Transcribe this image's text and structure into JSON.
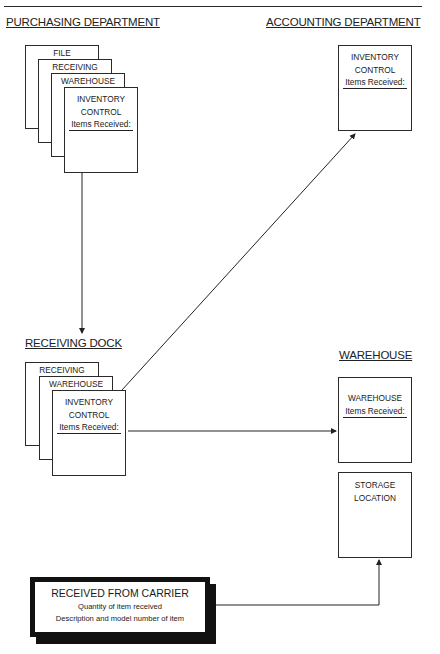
{
  "sections": {
    "purchasing": {
      "title": "PURCHASING DEPARTMENT",
      "cards": [
        {
          "label": "FILE"
        },
        {
          "label": "RECEIVING"
        },
        {
          "label": "WAREHOUSE"
        },
        {
          "label_line1": "INVENTORY",
          "label_line2": "CONTROL",
          "items": "Items Received:"
        }
      ]
    },
    "accounting": {
      "title": "ACCOUNTING DEPARTMENT",
      "card": {
        "label_line1": "INVENTORY",
        "label_line2": "CONTROL",
        "items": "Items Received:"
      }
    },
    "receiving_dock": {
      "title": "RECEIVING DOCK",
      "cards": [
        {
          "label": "RECEIVING"
        },
        {
          "label": "WAREHOUSE"
        },
        {
          "label_line1": "INVENTORY",
          "label_line2": "CONTROL",
          "items": "Items Received:"
        }
      ]
    },
    "warehouse": {
      "title": "WAREHOUSE",
      "card": {
        "label": "WAREHOUSE",
        "items": "Items Received:"
      },
      "storage": {
        "label_line1": "STORAGE",
        "label_line2": "LOCATION"
      }
    },
    "carrier": {
      "title": "RECEIVED FROM CARRIER",
      "line1": "Quantity of item received",
      "line2": "Description and model number of item"
    }
  },
  "connections": [
    {
      "from": "purchasing.inventory_control",
      "to": "receiving_dock"
    },
    {
      "from": "receiving_dock.inventory_control",
      "to": "accounting.inventory_control"
    },
    {
      "from": "receiving_dock.inventory_control",
      "to": "warehouse.warehouse_card"
    },
    {
      "from": "carrier",
      "to": "warehouse.storage_location"
    }
  ]
}
